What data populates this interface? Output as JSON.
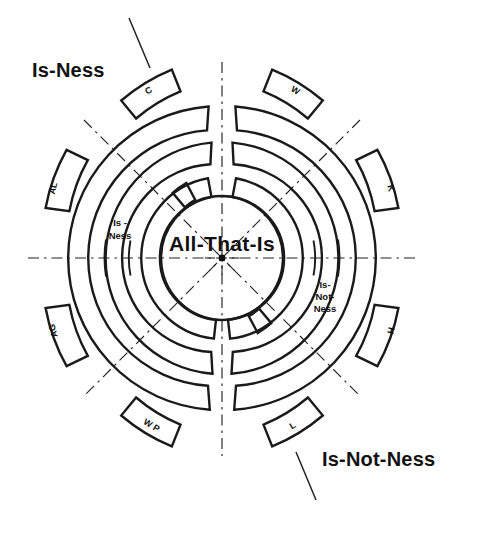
{
  "diagram": {
    "title_center": "All-That-Is",
    "center_marker": "center-dot",
    "side_labels": {
      "left": "Is-Ness",
      "right": "Is-Not-Ness"
    },
    "corner_labels": {
      "top_left": "Is-Ness",
      "bottom_right": "Is-Not-Ness"
    },
    "inner_annotations": [
      {
        "id": "is-ness-inner",
        "lines": [
          "Is -",
          "Ness"
        ],
        "side": "left"
      },
      {
        "id": "is-not-ness-inner",
        "lines": [
          "Is-",
          "Not-",
          "Ness"
        ],
        "side": "right"
      }
    ],
    "outer_ring_segments": [
      {
        "id": "segment-c",
        "label": "C",
        "quadrant": "top-left",
        "side": "is-ness"
      },
      {
        "id": "segment-w",
        "label": "W",
        "quadrant": "top-right",
        "side": "is-not-ness"
      },
      {
        "id": "segment-al",
        "label": "AL",
        "quadrant": "upper-left",
        "side": "is-ness"
      },
      {
        "id": "segment-k",
        "label": "K",
        "quadrant": "upper-right",
        "side": "is-not-ness"
      },
      {
        "id": "segment-ag",
        "label": "AG",
        "quadrant": "lower-left",
        "side": "is-ness"
      },
      {
        "id": "segment-h",
        "label": "H",
        "quadrant": "lower-right",
        "side": "is-not-ness"
      },
      {
        "id": "segment-wp",
        "label": "W P",
        "quadrant": "bottom-left",
        "side": "is-ness"
      },
      {
        "id": "segment-l",
        "label": "L",
        "quadrant": "bottom-right",
        "side": "is-not-ness"
      }
    ],
    "colors": {
      "ink": "#1a1a1a",
      "background": "#ffffff",
      "axis": "#222222"
    },
    "geometry": {
      "center_x": 222,
      "center_y": 258,
      "ring_count": 4,
      "axis_count": 4
    }
  }
}
